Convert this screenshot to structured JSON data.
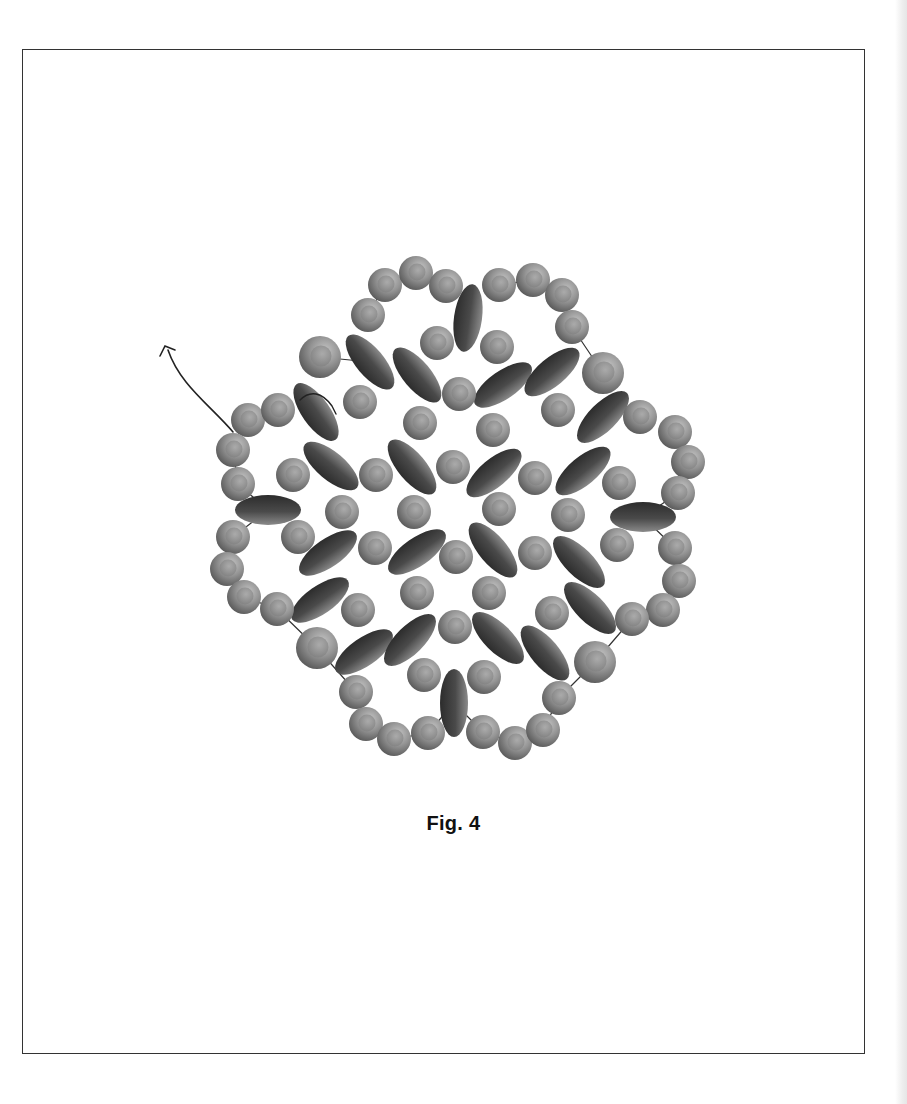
{
  "figure": {
    "caption": "Fig. 4",
    "colors": {
      "frame_border": "#333333",
      "thread": "#222222",
      "round_bead_light": "#b5b5b5",
      "round_bead_mid": "#8a8a8a",
      "round_bead_dark": "#555555",
      "oval_bead_light": "#8c8c8c",
      "oval_bead_dark": "#2e2e2e"
    },
    "thread_path": {
      "start": [
        233,
        432
      ],
      "arrow_tip": [
        163,
        347
      ]
    },
    "round_beads": [
      [
        385,
        285,
        17
      ],
      [
        416,
        273,
        17
      ],
      [
        446,
        286,
        17
      ],
      [
        499,
        285,
        17
      ],
      [
        533,
        280,
        17
      ],
      [
        562,
        295,
        17
      ],
      [
        572,
        327,
        17
      ],
      [
        368,
        315,
        17
      ],
      [
        320,
        357,
        21
      ],
      [
        437,
        343,
        17
      ],
      [
        497,
        347,
        17
      ],
      [
        603,
        373,
        21
      ],
      [
        248,
        420,
        17
      ],
      [
        278,
        410,
        17
      ],
      [
        360,
        402,
        17
      ],
      [
        420,
        423,
        17
      ],
      [
        459,
        394,
        17
      ],
      [
        493,
        430,
        17
      ],
      [
        558,
        410,
        17
      ],
      [
        640,
        417,
        17
      ],
      [
        644,
        416,
        0
      ],
      [
        675,
        432,
        17
      ],
      [
        688,
        462,
        17
      ],
      [
        233,
        450,
        17
      ],
      [
        238,
        484,
        17
      ],
      [
        293,
        475,
        17
      ],
      [
        376,
        475,
        17
      ],
      [
        453,
        467,
        17
      ],
      [
        535,
        478,
        17
      ],
      [
        619,
        483,
        17
      ],
      [
        678,
        493,
        17
      ],
      [
        342,
        512,
        17
      ],
      [
        414,
        512,
        17
      ],
      [
        499,
        509,
        17
      ],
      [
        568,
        515,
        17
      ],
      [
        233,
        537,
        17
      ],
      [
        298,
        537,
        17
      ],
      [
        375,
        548,
        17
      ],
      [
        456,
        557,
        17
      ],
      [
        535,
        553,
        17
      ],
      [
        617,
        545,
        17
      ],
      [
        675,
        548,
        17
      ],
      [
        227,
        569,
        17
      ],
      [
        244,
        597,
        17
      ],
      [
        277,
        609,
        17
      ],
      [
        358,
        610,
        17
      ],
      [
        417,
        593,
        17
      ],
      [
        489,
        593,
        17
      ],
      [
        552,
        613,
        17
      ],
      [
        679,
        581,
        17
      ],
      [
        663,
        610,
        17
      ],
      [
        632,
        619,
        17
      ],
      [
        317,
        648,
        21
      ],
      [
        455,
        627,
        17
      ],
      [
        595,
        662,
        21
      ],
      [
        424,
        675,
        17
      ],
      [
        484,
        677,
        17
      ],
      [
        356,
        692,
        17
      ],
      [
        559,
        698,
        17
      ],
      [
        366,
        724,
        17
      ],
      [
        394,
        739,
        17
      ],
      [
        428,
        733,
        17
      ],
      [
        483,
        732,
        17
      ],
      [
        515,
        743,
        17
      ],
      [
        543,
        730,
        17
      ]
    ],
    "oval_beads": [
      [
        468,
        318,
        14,
        34,
        8
      ],
      [
        370,
        362,
        14,
        34,
        -40
      ],
      [
        417,
        375,
        14,
        34,
        -40
      ],
      [
        503,
        385,
        14,
        34,
        55
      ],
      [
        552,
        372,
        14,
        34,
        50
      ],
      [
        316,
        412,
        14,
        34,
        -35
      ],
      [
        603,
        417,
        14,
        34,
        45
      ],
      [
        412,
        467,
        14,
        34,
        -40
      ],
      [
        331,
        466,
        14,
        34,
        -50
      ],
      [
        494,
        473,
        14,
        34,
        50
      ],
      [
        583,
        471,
        14,
        34,
        50
      ],
      [
        268,
        510,
        15,
        33,
        90
      ],
      [
        643,
        517,
        15,
        33,
        90
      ],
      [
        328,
        553,
        14,
        34,
        55
      ],
      [
        417,
        552,
        14,
        34,
        55
      ],
      [
        493,
        550,
        14,
        34,
        -40
      ],
      [
        579,
        562,
        14,
        34,
        -45
      ],
      [
        320,
        600,
        14,
        34,
        55
      ],
      [
        590,
        608,
        14,
        34,
        -45
      ],
      [
        364,
        652,
        14,
        34,
        55
      ],
      [
        410,
        640,
        14,
        34,
        45
      ],
      [
        498,
        638,
        14,
        34,
        -45
      ],
      [
        545,
        653,
        14,
        34,
        -40
      ],
      [
        454,
        703,
        14,
        34,
        0
      ]
    ]
  }
}
